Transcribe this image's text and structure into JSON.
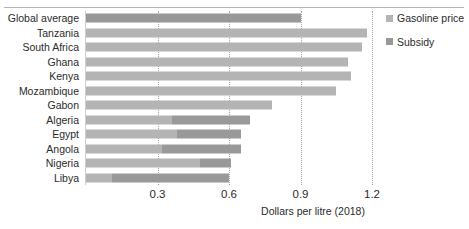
{
  "chart_data": {
    "type": "bar",
    "orientation": "horizontal",
    "stacked": true,
    "title": "",
    "xlabel": "Dollars per litre (2018)",
    "ylabel": "",
    "xlim": [
      0,
      1.2
    ],
    "xticks": [
      "0.3",
      "0.6",
      "0.9",
      "1.2"
    ],
    "xtick_values": [
      0.3,
      0.6,
      0.9,
      1.2
    ],
    "grid": "vertical-dotted",
    "legend_position": "right",
    "categories": [
      "Global average",
      "Tanzania",
      "South Africa",
      "Ghana",
      "Kenya",
      "Mozambique",
      "Gabon",
      "Algeria",
      "Egypt",
      "Angola",
      "Nigeria",
      "Libya"
    ],
    "series": [
      {
        "name": "Gasoline price",
        "color": "#b4b4b4",
        "values": [
          0.9,
          1.18,
          1.16,
          1.1,
          1.11,
          1.05,
          0.78,
          0.36,
          0.38,
          0.32,
          0.48,
          0.11
        ]
      },
      {
        "name": "Subsidy",
        "color": "#999999",
        "values": [
          0.0,
          0.0,
          0.0,
          0.0,
          0.0,
          0.0,
          0.0,
          0.33,
          0.27,
          0.33,
          0.13,
          0.49
        ]
      }
    ],
    "totals": [
      0.9,
      1.18,
      1.16,
      1.1,
      1.11,
      1.05,
      0.78,
      0.69,
      0.65,
      0.65,
      0.61,
      0.6
    ],
    "highlight_category": "Global average"
  },
  "legend": {
    "items": [
      {
        "label": "Gasoline price",
        "color": "#b4b4b4"
      },
      {
        "label": "Subsidy",
        "color": "#999999"
      }
    ]
  }
}
